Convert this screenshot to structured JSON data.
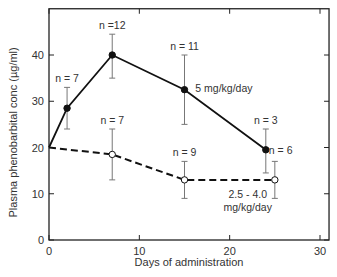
{
  "chart_data": {
    "type": "line",
    "title": "",
    "xlabel": "Days of administration",
    "ylabel": "Plasma phenobarbital conc (µg/ml)",
    "xlim": [
      0,
      31
    ],
    "ylim": [
      0,
      50
    ],
    "xticks": [
      0,
      10,
      20,
      30
    ],
    "yticks": [
      0,
      10,
      20,
      30,
      40
    ],
    "grid": false,
    "legend": "inline labels",
    "series": [
      {
        "name": "5 mg/kg/day",
        "style": "solid, filled circles",
        "x": [
          0,
          2,
          7,
          15,
          24
        ],
        "y": [
          20,
          28.5,
          40,
          32.5,
          19.5
        ],
        "err_low": [
          null,
          24,
          35,
          25,
          14.5
        ],
        "err_high": [
          null,
          33,
          44.5,
          40,
          24
        ],
        "n_labels": [
          null,
          "n = 7",
          "n =12",
          "n = 11",
          "n = 3"
        ]
      },
      {
        "name": "2.5 - 4.0 mg/kg/day",
        "style": "dashed, open circles",
        "x": [
          0,
          7,
          15,
          25
        ],
        "y": [
          20,
          18.5,
          13,
          13
        ],
        "err_low": [
          null,
          13,
          9,
          9
        ],
        "err_high": [
          null,
          24,
          17,
          17
        ],
        "n_labels": [
          null,
          "n = 7",
          "n = 9",
          "n = 6"
        ]
      }
    ],
    "annotations": [
      {
        "text": "5 mg/kg/day",
        "x": 16.2,
        "y": 32
      },
      {
        "text": "2.5 - 4.0",
        "x": 22,
        "y": 9
      },
      {
        "text": "mg/kg/day",
        "x": 22,
        "y": 6.3
      }
    ]
  }
}
